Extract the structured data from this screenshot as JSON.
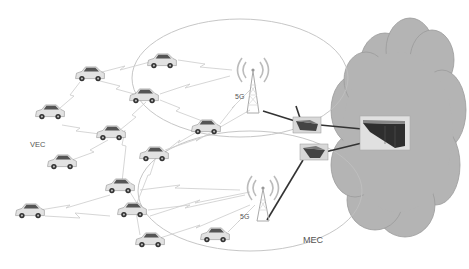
{
  "labels": {
    "vec": "VEC",
    "mec": "MEC",
    "tower_top": "5G",
    "tower_bottom": "5G"
  },
  "colors": {
    "cloud": "#b4b4b4",
    "cloud_stroke": "#9a9a9a",
    "link": "#c8c8c8",
    "backhaul": "#333333",
    "ellipse": "#c0c0c0"
  },
  "vehicles": [
    {
      "x": 90,
      "y": 75
    },
    {
      "x": 162,
      "y": 62
    },
    {
      "x": 144,
      "y": 97
    },
    {
      "x": 50,
      "y": 113
    },
    {
      "x": 111,
      "y": 134
    },
    {
      "x": 62,
      "y": 163
    },
    {
      "x": 154,
      "y": 155
    },
    {
      "x": 206,
      "y": 128
    },
    {
      "x": 120,
      "y": 187
    },
    {
      "x": 30,
      "y": 212
    },
    {
      "x": 132,
      "y": 211
    },
    {
      "x": 150,
      "y": 241
    },
    {
      "x": 215,
      "y": 236
    }
  ]
}
